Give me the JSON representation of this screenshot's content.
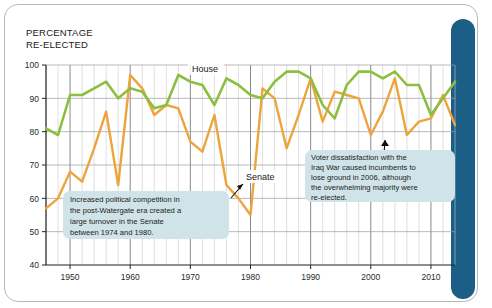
{
  "card": {
    "accent_color": "#1b5e86",
    "border_color": "#b8b8b8",
    "background": "#ffffff"
  },
  "title": {
    "line1": "PERCENTAGE",
    "line2": "RE-ELECTED"
  },
  "series_labels": {
    "house": "House",
    "senate": "Senate"
  },
  "callouts": [
    {
      "name": "watergate-callout",
      "background": "#cfe3e8",
      "lines": [
        "Increased political competition in",
        "the post-Watergate era created a",
        "large turnover in the Senate",
        "between 1974 and 1980."
      ]
    },
    {
      "name": "iraq-war-callout",
      "background": "#cfe3e8",
      "lines": [
        "Voter dissatisfaction with the",
        "Iraq War caused incumbents to",
        "lose ground in 2006, although",
        "the overwhelming majority were",
        "re-elected."
      ]
    }
  ],
  "chart_data": {
    "type": "line",
    "title": "PERCENTAGE RE-ELECTED",
    "xlabel": "",
    "ylabel": "PERCENTAGE RE-ELECTED",
    "xlim": [
      1946,
      2014
    ],
    "ylim": [
      40,
      100
    ],
    "ytick_labels": [
      "40",
      "50",
      "60",
      "70",
      "80",
      "90",
      "100"
    ],
    "yticks": [
      40,
      50,
      60,
      70,
      80,
      90,
      100
    ],
    "xtick_labels": [
      "1950",
      "1960",
      "1970",
      "1980",
      "1990",
      "2000",
      "2010"
    ],
    "xticks": [
      1950,
      1960,
      1970,
      1980,
      1990,
      2000,
      2010
    ],
    "gridline_interval_years": 2,
    "grid": true,
    "legend_position": "inline-labels",
    "x": [
      1946,
      1948,
      1950,
      1952,
      1954,
      1956,
      1958,
      1960,
      1962,
      1964,
      1966,
      1968,
      1970,
      1972,
      1974,
      1976,
      1978,
      1980,
      1982,
      1984,
      1986,
      1988,
      1990,
      1992,
      1994,
      1996,
      1998,
      2000,
      2002,
      2004,
      2006,
      2008,
      2010,
      2012,
      2014
    ],
    "series": [
      {
        "name": "House",
        "color": "#8cbf3f",
        "values": [
          81,
          79,
          91,
          91,
          93,
          95,
          90,
          93,
          92,
          87,
          88,
          97,
          95,
          94,
          88,
          96,
          94,
          91,
          90,
          95,
          98,
          98,
          96,
          88,
          84,
          94,
          98,
          98,
          96,
          98,
          94,
          94,
          85,
          90,
          95
        ]
      },
      {
        "name": "Senate",
        "color": "#eda43c",
        "values": [
          57,
          60,
          68,
          65,
          75,
          86,
          64,
          97,
          93,
          85,
          88,
          87,
          77,
          74,
          85,
          64,
          60,
          55,
          93,
          90,
          75,
          85,
          96,
          83,
          92,
          91,
          90,
          79,
          86,
          96,
          79,
          83,
          84,
          91,
          82
        ]
      }
    ],
    "annotations": [
      {
        "target_year": 1979,
        "target_value": 60,
        "text": "Increased political competition in the post-Watergate era created a large turnover in the Senate between 1974 and 1980."
      },
      {
        "target_year": 2006,
        "target_value": 79,
        "text": "Voter dissatisfaction with the Iraq War caused incumbents to lose ground in 2006, although the overwhelming majority were re-elected."
      }
    ]
  }
}
